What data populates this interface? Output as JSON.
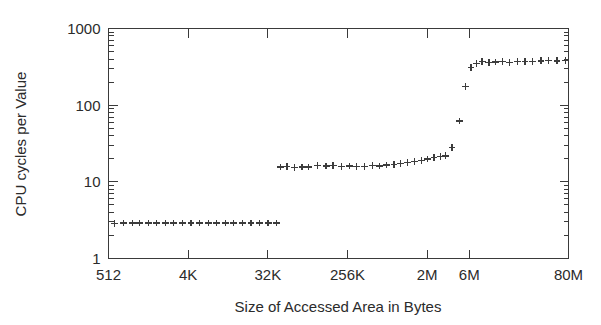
{
  "chart_data": {
    "type": "scatter",
    "title": "",
    "xlabel": "Size of Accessed Area in Bytes",
    "ylabel": "CPU cycles per Value",
    "marker": "plus",
    "grid": false,
    "legend": null,
    "xscale": "log",
    "yscale": "log",
    "xlim": [
      512,
      83886080
    ],
    "ylim": [
      1,
      1000
    ],
    "x_tick_labels": [
      "512",
      "4K",
      "32K",
      "256K",
      "2M",
      "6M",
      "80M"
    ],
    "x_tick_values": [
      512,
      4096,
      32768,
      262144,
      2097152,
      6291456,
      83886080
    ],
    "y_tick_labels": [
      "1",
      "10",
      "100",
      "1000"
    ],
    "y_tick_values": [
      1,
      10,
      100,
      1000
    ],
    "series": [
      {
        "name": "CPU cycles per Value",
        "points": [
          [
            600,
            2.85
          ],
          [
            760,
            2.9
          ],
          [
            950,
            2.9
          ],
          [
            1150,
            2.9
          ],
          [
            1450,
            2.9
          ],
          [
            1800,
            2.9
          ],
          [
            2250,
            2.9
          ],
          [
            2800,
            2.9
          ],
          [
            3500,
            2.9
          ],
          [
            4400,
            2.9
          ],
          [
            5500,
            2.9
          ],
          [
            6900,
            2.9
          ],
          [
            8600,
            2.9
          ],
          [
            10800,
            2.9
          ],
          [
            13500,
            2.9
          ],
          [
            16900,
            2.9
          ],
          [
            21100,
            2.9
          ],
          [
            26400,
            2.9
          ],
          [
            33000,
            2.9
          ],
          [
            41300,
            2.9
          ],
          [
            46000,
            15.6
          ],
          [
            54000,
            15.7
          ],
          [
            66000,
            15.5
          ],
          [
            80000,
            15.6
          ],
          [
            95000,
            15.6
          ],
          [
            120000,
            16.2
          ],
          [
            150000,
            16.1
          ],
          [
            180000,
            16.2
          ],
          [
            225000,
            16.0
          ],
          [
            275000,
            16.1
          ],
          [
            330000,
            16.0
          ],
          [
            410000,
            16.0
          ],
          [
            500000,
            16.2
          ],
          [
            600000,
            16.1
          ],
          [
            730000,
            16.6
          ],
          [
            880000,
            16.8
          ],
          [
            1050000,
            17.4
          ],
          [
            1250000,
            17.8
          ],
          [
            1500000,
            18.4
          ],
          [
            1800000,
            19.1
          ],
          [
            2100000,
            19.8
          ],
          [
            2500000,
            20.6
          ],
          [
            2950000,
            21.4
          ],
          [
            3400000,
            21.8
          ],
          [
            4000000,
            28.0
          ],
          [
            4900000,
            62.0
          ],
          [
            5700000,
            175.0
          ],
          [
            6600000,
            310.0
          ],
          [
            7600000,
            350.0
          ],
          [
            8800000,
            375.0
          ],
          [
            10500000,
            360.0
          ],
          [
            12500000,
            365.0
          ],
          [
            15000000,
            370.0
          ],
          [
            18000000,
            362.0
          ],
          [
            22000000,
            370.0
          ],
          [
            27000000,
            368.0
          ],
          [
            33000000,
            375.0
          ],
          [
            41000000,
            378.0
          ],
          [
            50000000,
            380.0
          ],
          [
            62000000,
            378.0
          ],
          [
            78000000,
            382.0
          ]
        ]
      }
    ]
  },
  "axes": {
    "y_title": "CPU cycles per Value",
    "x_title": "Size of Accessed Area in Bytes",
    "y_labels": [
      "1000",
      "100",
      "10",
      "1"
    ],
    "x_labels": [
      "512",
      "4K",
      "32K",
      "256K",
      "2M",
      "6M",
      "80M"
    ]
  },
  "colors": {
    "axis": "#3a3a3a",
    "marker": "#3c3c3c",
    "text": "#2b2b2b",
    "background": "#ffffff"
  }
}
